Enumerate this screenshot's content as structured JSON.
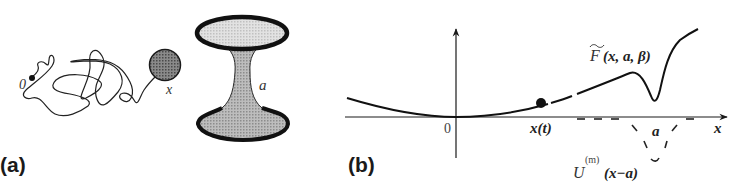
{
  "figure": {
    "panel_a": {
      "label": "(a)",
      "origin_label": "0",
      "particle_label": "x",
      "obstacle_label": "a"
    },
    "panel_b": {
      "label": "(b)",
      "origin_label": "0",
      "particle_position_label": "x(t)",
      "x_axis_label": "x",
      "well_position_label": "a",
      "curve_label": {
        "symbol": "F",
        "args": "(x, a, β)"
      },
      "potential_label": {
        "symbol": "U",
        "superscript": "(m)",
        "args": "(x−a)"
      }
    },
    "colors": {
      "ink": "#1a1a1a",
      "label_gray": "#444444",
      "sphere_fill": "#6e6e6e",
      "hourglass_neck_fill": "#a8a8a8",
      "hourglass_top_fill": "#d4d4d4",
      "hourglass_bottom_fill": "#b4b4b4",
      "background": "#ffffff"
    }
  }
}
